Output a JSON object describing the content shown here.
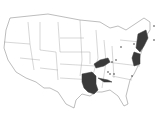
{
  "map": {
    "title": "United States",
    "highlight_color": "#3a3a3a",
    "base_color": "#ffffff",
    "border_color": "#7a7a7a",
    "highlighted_regions": [
      "Louisiana",
      "Arkansas (southern)",
      "Kentucky (western)",
      "Tennessee band",
      "Virginia/Maryland/Delaware",
      "New England (NH, MA, CT, RI)",
      "New York/New Jersey east"
    ],
    "markers": 10
  }
}
